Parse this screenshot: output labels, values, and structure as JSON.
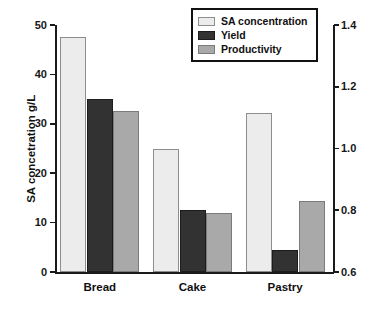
{
  "chart_data": {
    "type": "bar",
    "title": "",
    "categories": [
      "Bread",
      "Cake",
      "Pastry"
    ],
    "series": [
      {
        "name": "SA concentration",
        "axis": "left",
        "color": "#ececec",
        "values": [
          47.5,
          25.0,
          32.2
        ]
      },
      {
        "name": "Yield",
        "axis": "right",
        "color": "#323232",
        "values": [
          1.16,
          0.8,
          0.67
        ]
      },
      {
        "name": "Productivity",
        "axis": "right",
        "color": "#a9a9a9",
        "values": [
          1.12,
          0.79,
          0.83
        ]
      }
    ],
    "xlabel": "",
    "ylabel": "SA concetration g/L",
    "ylabel_right": "Yield SA/g sugar and productivity g/L.hr",
    "ylim": [
      0,
      50
    ],
    "ylim_right": [
      0.6,
      1.4
    ],
    "yticks": [
      0,
      10,
      20,
      30,
      40,
      50
    ],
    "yticks_right": [
      0.6,
      0.8,
      1.0,
      1.2,
      1.4
    ],
    "grid": false,
    "legend_position": "top-center"
  },
  "axes": {
    "left_title": "SA concetration g/L",
    "right_title": "Yield SA/g sugar and productivity g/L.hr",
    "left_ticks": [
      "50",
      "40",
      "30",
      "20",
      "10",
      "0"
    ],
    "right_ticks": [
      "1.4",
      "1.2",
      "1.0",
      "0.8",
      "0.6"
    ]
  },
  "legend": {
    "items": [
      {
        "label": "SA concentration",
        "color": "#ececec"
      },
      {
        "label": "Yield",
        "color": "#323232"
      },
      {
        "label": "Productivity",
        "color": "#a9a9a9"
      }
    ]
  },
  "categories": [
    {
      "label": "Bread"
    },
    {
      "label": "Cake"
    },
    {
      "label": "Pastry"
    }
  ]
}
